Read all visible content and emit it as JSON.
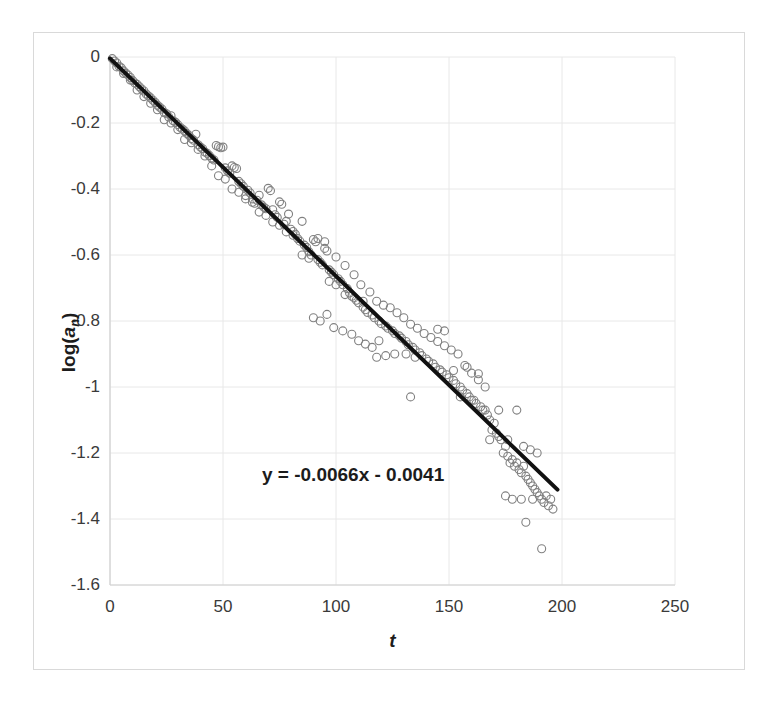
{
  "chart_data": {
    "type": "scatter",
    "title": "",
    "xlabel": "t",
    "ylabel": "log(a_n)",
    "ylabel_html": "log(<i>a</i><sub>n</sub>)",
    "xlim": [
      0,
      250
    ],
    "ylim": [
      -1.6,
      0
    ],
    "xticks": [
      0,
      50,
      100,
      150,
      200,
      250
    ],
    "xtick_labels": [
      "0",
      "50",
      "100",
      "150",
      "200",
      "250"
    ],
    "yticks": [
      0,
      -0.2,
      -0.4,
      -0.6,
      -0.8,
      -1,
      -1.2,
      -1.4,
      -1.6
    ],
    "ytick_labels": [
      "0",
      "-0.2",
      "-0.4",
      "-0.6",
      "-0.8",
      "-1",
      "-1.2",
      "-1.4",
      "-1.6"
    ],
    "grid": true,
    "grid_color": "#e8e8e8",
    "axis_color": "#d0d0d0",
    "legend": null,
    "annotations": [
      {
        "text": "y = -0.0066x - 0.0041",
        "x": 75,
        "y": -1.26,
        "name": "trendline-equation"
      }
    ],
    "trendline": {
      "type": "linear",
      "equation": "y = -0.0066x - 0.0041",
      "slope": -0.0066,
      "intercept": -0.0041,
      "x_start": 0,
      "x_end": 198,
      "color": "#111111",
      "width": 4
    },
    "marker": {
      "style": "open-circle",
      "size": 8,
      "edge_color": "#808080",
      "fill": "none"
    },
    "series": [
      {
        "name": "log(a_n) observations",
        "points": [
          [
            1,
            -0.005
          ],
          [
            2,
            -0.012
          ],
          [
            3,
            -0.018
          ],
          [
            4,
            -0.028
          ],
          [
            5,
            -0.033
          ],
          [
            6,
            -0.042
          ],
          [
            7,
            -0.049
          ],
          [
            8,
            -0.055
          ],
          [
            9,
            -0.062
          ],
          [
            10,
            -0.071
          ],
          [
            11,
            -0.079
          ],
          [
            12,
            -0.083
          ],
          [
            13,
            -0.09
          ],
          [
            14,
            -0.097
          ],
          [
            15,
            -0.103
          ],
          [
            16,
            -0.112
          ],
          [
            17,
            -0.118
          ],
          [
            18,
            -0.124
          ],
          [
            19,
            -0.131
          ],
          [
            20,
            -0.138
          ],
          [
            21,
            -0.146
          ],
          [
            22,
            -0.152
          ],
          [
            23,
            -0.158
          ],
          [
            24,
            -0.168
          ],
          [
            25,
            -0.172
          ],
          [
            26,
            -0.182
          ],
          [
            27,
            -0.178
          ],
          [
            28,
            -0.193
          ],
          [
            29,
            -0.198
          ],
          [
            30,
            -0.205
          ],
          [
            31,
            -0.213
          ],
          [
            32,
            -0.218
          ],
          [
            33,
            -0.224
          ],
          [
            34,
            -0.232
          ],
          [
            35,
            -0.238
          ],
          [
            36,
            -0.247
          ],
          [
            37,
            -0.252
          ],
          [
            38,
            -0.234
          ],
          [
            39,
            -0.266
          ],
          [
            40,
            -0.273
          ],
          [
            41,
            -0.278
          ],
          [
            42,
            -0.288
          ],
          [
            43,
            -0.292
          ],
          [
            44,
            -0.299
          ],
          [
            45,
            -0.307
          ],
          [
            46,
            -0.312
          ],
          [
            47,
            -0.268
          ],
          [
            48,
            -0.272
          ],
          [
            49,
            -0.275
          ],
          [
            50,
            -0.273
          ],
          [
            51,
            -0.336
          ],
          [
            52,
            -0.345
          ],
          [
            53,
            -0.352
          ],
          [
            54,
            -0.33
          ],
          [
            55,
            -0.335
          ],
          [
            56,
            -0.338
          ],
          [
            57,
            -0.377
          ],
          [
            58,
            -0.384
          ],
          [
            59,
            -0.392
          ],
          [
            60,
            -0.42
          ],
          [
            61,
            -0.404
          ],
          [
            62,
            -0.412
          ],
          [
            63,
            -0.43
          ],
          [
            64,
            -0.443
          ],
          [
            65,
            -0.434
          ],
          [
            66,
            -0.419
          ],
          [
            67,
            -0.448
          ],
          [
            68,
            -0.455
          ],
          [
            69,
            -0.46
          ],
          [
            70,
            -0.398
          ],
          [
            71,
            -0.405
          ],
          [
            72,
            -0.463
          ],
          [
            73,
            -0.478
          ],
          [
            74,
            -0.486
          ],
          [
            75,
            -0.439
          ],
          [
            76,
            -0.446
          ],
          [
            77,
            -0.507
          ],
          [
            78,
            -0.498
          ],
          [
            79,
            -0.476
          ],
          [
            80,
            -0.522
          ],
          [
            81,
            -0.529
          ],
          [
            82,
            -0.537
          ],
          [
            83,
            -0.55
          ],
          [
            84,
            -0.558
          ],
          [
            85,
            -0.498
          ],
          [
            86,
            -0.57
          ],
          [
            87,
            -0.577
          ],
          [
            88,
            -0.59
          ],
          [
            89,
            -0.6
          ],
          [
            90,
            -0.553
          ],
          [
            91,
            -0.56
          ],
          [
            92,
            -0.614
          ],
          [
            93,
            -0.622
          ],
          [
            94,
            -0.63
          ],
          [
            95,
            -0.58
          ],
          [
            96,
            -0.588
          ],
          [
            97,
            -0.645
          ],
          [
            98,
            -0.652
          ],
          [
            99,
            -0.66
          ],
          [
            100,
            -0.606
          ],
          [
            101,
            -0.672
          ],
          [
            102,
            -0.68
          ],
          [
            103,
            -0.69
          ],
          [
            104,
            -0.632
          ],
          [
            105,
            -0.702
          ],
          [
            106,
            -0.715
          ],
          [
            107,
            -0.725
          ],
          [
            108,
            -0.66
          ],
          [
            109,
            -0.737
          ],
          [
            110,
            -0.745
          ],
          [
            111,
            -0.69
          ],
          [
            112,
            -0.758
          ],
          [
            113,
            -0.766
          ],
          [
            114,
            -0.774
          ],
          [
            115,
            -0.712
          ],
          [
            116,
            -0.782
          ],
          [
            117,
            -0.79
          ],
          [
            118,
            -0.74
          ],
          [
            119,
            -0.8
          ],
          [
            120,
            -0.808
          ],
          [
            121,
            -0.752
          ],
          [
            122,
            -0.815
          ],
          [
            123,
            -0.822
          ],
          [
            124,
            -0.76
          ],
          [
            125,
            -0.83
          ],
          [
            126,
            -0.838
          ],
          [
            127,
            -0.775
          ],
          [
            128,
            -0.845
          ],
          [
            129,
            -0.852
          ],
          [
            130,
            -0.79
          ],
          [
            131,
            -0.862
          ],
          [
            132,
            -0.872
          ],
          [
            133,
            -0.81
          ],
          [
            134,
            -0.88
          ],
          [
            135,
            -0.888
          ],
          [
            136,
            -0.822
          ],
          [
            137,
            -0.896
          ],
          [
            138,
            -0.905
          ],
          [
            139,
            -0.838
          ],
          [
            140,
            -0.915
          ],
          [
            141,
            -0.922
          ],
          [
            142,
            -0.85
          ],
          [
            143,
            -0.93
          ],
          [
            144,
            -0.94
          ],
          [
            145,
            -0.862
          ],
          [
            146,
            -0.948
          ],
          [
            147,
            -0.955
          ],
          [
            148,
            -0.875
          ],
          [
            149,
            -0.963
          ],
          [
            150,
            -0.972
          ],
          [
            151,
            -0.888
          ],
          [
            152,
            -0.98
          ],
          [
            153,
            -0.99
          ],
          [
            154,
            -0.9
          ],
          [
            155,
            -1.0
          ],
          [
            156,
            -1.01
          ],
          [
            157,
            -0.935
          ],
          [
            158,
            -1.02
          ],
          [
            159,
            -1.03
          ],
          [
            160,
            -0.958
          ],
          [
            161,
            -1.04
          ],
          [
            162,
            -1.05
          ],
          [
            163,
            -0.978
          ],
          [
            164,
            -1.06
          ],
          [
            165,
            -1.07
          ],
          [
            166,
            -1.0
          ],
          [
            167,
            -1.085
          ],
          [
            168,
            -1.1
          ],
          [
            169,
            -1.13
          ],
          [
            170,
            -1.11
          ],
          [
            171,
            -1.14
          ],
          [
            172,
            -1.15
          ],
          [
            173,
            -1.16
          ],
          [
            174,
            -1.2
          ],
          [
            175,
            -1.18
          ],
          [
            176,
            -1.21
          ],
          [
            177,
            -1.23
          ],
          [
            178,
            -1.22
          ],
          [
            179,
            -1.24
          ],
          [
            180,
            -1.23
          ],
          [
            181,
            -1.25
          ],
          [
            182,
            -1.26
          ],
          [
            183,
            -1.24
          ],
          [
            184,
            -1.27
          ],
          [
            185,
            -1.28
          ],
          [
            186,
            -1.29
          ],
          [
            187,
            -1.3
          ],
          [
            188,
            -1.31
          ],
          [
            189,
            -1.32
          ],
          [
            190,
            -1.33
          ],
          [
            191,
            -1.34
          ],
          [
            192,
            -1.35
          ],
          [
            193,
            -1.33
          ],
          [
            194,
            -1.36
          ],
          [
            195,
            -1.34
          ],
          [
            196,
            -1.37
          ],
          [
            118,
            -0.91
          ],
          [
            122,
            -0.905
          ],
          [
            126,
            -0.9
          ],
          [
            131,
            -0.9
          ],
          [
            135,
            -0.91
          ],
          [
            145,
            -0.825
          ],
          [
            148,
            -0.83
          ],
          [
            133,
            -1.03
          ],
          [
            152,
            -0.95
          ],
          [
            158,
            -0.94
          ],
          [
            163,
            -0.96
          ],
          [
            166,
            -1.07
          ],
          [
            155,
            -1.03
          ],
          [
            160,
            -1.04
          ],
          [
            172,
            -1.07
          ],
          [
            180,
            -1.07
          ],
          [
            168,
            -1.16
          ],
          [
            176,
            -1.16
          ],
          [
            183,
            -1.18
          ],
          [
            186,
            -1.19
          ],
          [
            189,
            -1.2
          ],
          [
            184,
            -1.41
          ],
          [
            191,
            -1.49
          ],
          [
            175,
            -1.33
          ],
          [
            178,
            -1.34
          ],
          [
            182,
            -1.34
          ],
          [
            187,
            -1.34
          ],
          [
            90,
            -0.79
          ],
          [
            93,
            -0.8
          ],
          [
            96,
            -0.78
          ],
          [
            99,
            -0.82
          ],
          [
            103,
            -0.83
          ],
          [
            107,
            -0.84
          ],
          [
            110,
            -0.86
          ],
          [
            113,
            -0.87
          ],
          [
            116,
            -0.88
          ],
          [
            119,
            -0.86
          ],
          [
            104,
            -0.72
          ],
          [
            108,
            -0.73
          ],
          [
            112,
            -0.74
          ],
          [
            97,
            -0.68
          ],
          [
            100,
            -0.69
          ],
          [
            85,
            -0.6
          ],
          [
            88,
            -0.61
          ],
          [
            92,
            -0.55
          ],
          [
            95,
            -0.56
          ],
          [
            78,
            -0.53
          ],
          [
            81,
            -0.54
          ],
          [
            72,
            -0.5
          ],
          [
            75,
            -0.51
          ],
          [
            66,
            -0.47
          ],
          [
            69,
            -0.48
          ],
          [
            60,
            -0.43
          ],
          [
            63,
            -0.44
          ],
          [
            54,
            -0.4
          ],
          [
            57,
            -0.41
          ],
          [
            48,
            -0.36
          ],
          [
            51,
            -0.37
          ],
          [
            45,
            -0.33
          ],
          [
            42,
            -0.3
          ],
          [
            39,
            -0.28
          ],
          [
            36,
            -0.26
          ],
          [
            33,
            -0.25
          ],
          [
            30,
            -0.22
          ],
          [
            27,
            -0.2
          ],
          [
            24,
            -0.19
          ],
          [
            21,
            -0.16
          ],
          [
            18,
            -0.14
          ],
          [
            15,
            -0.12
          ],
          [
            12,
            -0.1
          ],
          [
            9,
            -0.07
          ],
          [
            6,
            -0.05
          ],
          [
            3,
            -0.03
          ]
        ]
      }
    ]
  }
}
